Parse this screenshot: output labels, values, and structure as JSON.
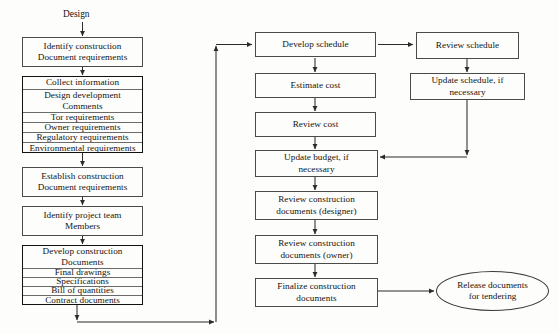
{
  "diagram": {
    "title_label": "Design",
    "nodes": {
      "identify_construction": "Identify construction\nDocument requirements",
      "establish_construction": "Establish construction\nDocument requirements",
      "identify_project_team": "Identify project team\nMembers",
      "develop_schedule": "Develop schedule",
      "estimate_cost": "Estimate cost",
      "review_cost": "Review cost",
      "update_budget": "Update budget, if\nnecessary",
      "review_docs_designer": "Review construction\ndocuments (designer)",
      "review_docs_owner": "Review construction\ndocuments (owner)",
      "finalize_docs": "Finalize construction\ndocuments",
      "review_schedule": "Review schedule",
      "update_schedule": "Update schedule, if\nnecessary",
      "release_documents": "Release  documents\nfor tendering"
    },
    "collect_information_group": {
      "rows": [
        "Collect information",
        "Design development\nComments",
        "Tor requirements",
        "Owner requirements",
        "Regulatory requirements",
        "Environmental requirements"
      ]
    },
    "develop_construction_group": {
      "rows": [
        "Develop construction\nDocuments",
        "Final drawings",
        "Specifications",
        "Bill of quantities",
        "Contract documents"
      ]
    },
    "colors": {
      "line": "#2b2b2b",
      "box_border": "#4a4a4a",
      "thick_border": "#111111",
      "background": "#fdfdfb",
      "text": "#141414"
    }
  }
}
